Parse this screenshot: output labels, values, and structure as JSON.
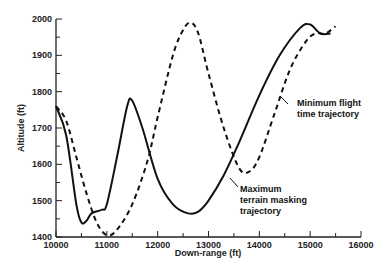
{
  "chart_data": {
    "type": "line",
    "title": "",
    "xlabel": "Down-range (ft)",
    "ylabel": "Altitude (ft)",
    "xlim": [
      10000,
      16000
    ],
    "ylim": [
      1400,
      2000
    ],
    "x_ticks": [
      "10000",
      "11000",
      "12000",
      "13000",
      "14000",
      "15000",
      "16000"
    ],
    "y_ticks": [
      "1400",
      "1500",
      "1600",
      "1700",
      "1800",
      "1900",
      "2000"
    ],
    "grid": false,
    "series": [
      {
        "name": "Maximum terrain masking trajectory",
        "style": "solid",
        "x": [
          10000,
          10200,
          10400,
          10500,
          10600,
          10700,
          10900,
          11000,
          11200,
          11400,
          11500,
          11700,
          12000,
          12300,
          12600,
          12800,
          13000,
          13300,
          13600,
          14000,
          14400,
          14800,
          15000,
          15200,
          15400
        ],
        "y": [
          1760,
          1680,
          1490,
          1440,
          1445,
          1465,
          1475,
          1490,
          1620,
          1760,
          1775,
          1700,
          1560,
          1490,
          1465,
          1470,
          1500,
          1570,
          1660,
          1790,
          1900,
          1975,
          1985,
          1960,
          1960
        ]
      },
      {
        "name": "Minimum flight time trajectory",
        "style": "dashed",
        "x": [
          10000,
          10200,
          10400,
          10600,
          10800,
          11000,
          11200,
          11500,
          11800,
          12000,
          12300,
          12500,
          12650,
          12800,
          13000,
          13300,
          13600,
          13800,
          14000,
          14300,
          14600,
          14900,
          15100,
          15300,
          15500
        ],
        "y": [
          1760,
          1720,
          1620,
          1520,
          1440,
          1405,
          1420,
          1490,
          1610,
          1730,
          1900,
          1970,
          1990,
          1960,
          1850,
          1700,
          1590,
          1580,
          1620,
          1740,
          1860,
          1935,
          1960,
          1960,
          1980
        ]
      }
    ],
    "annotations": [
      {
        "text": [
          "Minimum flight",
          "time trajectory"
        ],
        "target_series": "Minimum flight time trajectory"
      },
      {
        "text": [
          "Maximum",
          "terrain masking",
          "trajectory"
        ],
        "target_series": "Maximum terrain masking trajectory"
      }
    ]
  }
}
